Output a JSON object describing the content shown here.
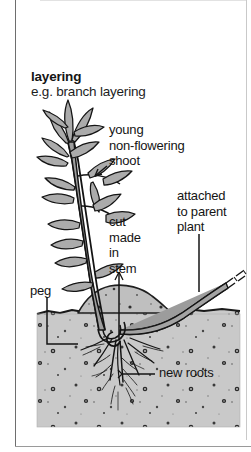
{
  "figure": {
    "title": "layering",
    "subtitle": "e.g. branch layering",
    "caption_alt": "Botanical line diagram showing branch layering propagation"
  },
  "labels": {
    "young_shoot": "young\nnon-flowering\nshoot",
    "cut_in_stem": "cut\nmade\nin\nstem",
    "attached_parent": "attached\nto parent\nplant",
    "peg": "peg",
    "new_roots": "new roots"
  },
  "colors": {
    "ink": "#141414",
    "soil_fill": "#c8c8c8",
    "soil_mound": "#bdbdbd",
    "leaf_fill": "#a8a8a8",
    "stem_fill": "#9a9a9a",
    "frame_line": "#6e6e6e",
    "page_white": "#ffffff"
  },
  "diagram": {
    "type": "botanical-illustration",
    "parts": [
      "young non-flowering shoot",
      "cut made in stem",
      "attached to parent plant",
      "peg",
      "new roots",
      "soil",
      "soil mound"
    ]
  }
}
